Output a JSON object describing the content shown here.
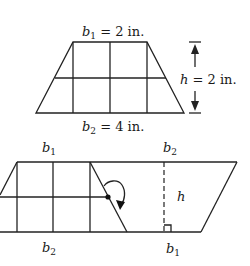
{
  "top_figure": {
    "shape": "trapezoid",
    "grid": {
      "columns": 2,
      "rows": 2
    },
    "top_base_label": {
      "var": "b",
      "sub": "1",
      "rest": " = 2 in."
    },
    "bottom_base_label": {
      "var": "b",
      "sub": "2",
      "rest": " = 4 in."
    },
    "height_label": {
      "var": "h",
      "rest": " = 2 in."
    }
  },
  "bottom_figure": {
    "shape": "parallelogram",
    "description": "trapezoid and its rotated copy combined into a parallelogram",
    "top_left_label": {
      "var": "b",
      "sub": "1"
    },
    "top_right_label": {
      "var": "b",
      "sub": "2"
    },
    "bottom_left_label": {
      "var": "b",
      "sub": "2"
    },
    "bottom_right_label": {
      "var": "b",
      "sub": "1"
    },
    "height_label": {
      "var": "h"
    },
    "rotation_marker": "clockwise-rotation-arrow",
    "right_angle_marker": true
  },
  "colors": {
    "stroke": "#222222",
    "background": "#ffffff"
  }
}
